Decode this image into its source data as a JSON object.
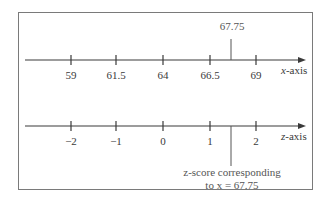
{
  "x_axis": {
    "name_var": "x",
    "name_suffix": "-axis",
    "ticks": [
      "59",
      "61.5",
      "64",
      "66.5",
      "69"
    ],
    "marker_label": "67.75"
  },
  "z_axis": {
    "name_var": "z",
    "name_suffix": "-axis",
    "ticks": [
      "−2",
      "−1",
      "0",
      "1",
      "2"
    ]
  },
  "annotation": {
    "line1": "z-score corresponding",
    "line2": "to x = 67.75"
  },
  "colors": {
    "line": "#3a3a3a",
    "border": "#7a7a7a",
    "text": "#3a3a3a"
  }
}
